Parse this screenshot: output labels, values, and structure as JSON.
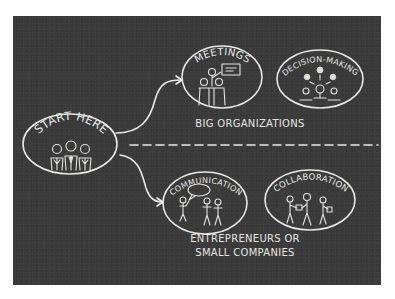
{
  "diagram": {
    "board_color": "#3b3b3b",
    "chalk_color": "#e8e8e4",
    "start_node": {
      "label": "START HERE",
      "people_count": 3
    },
    "upper_branch": {
      "caption": "BIG ORGANIZATIONS",
      "nodes": [
        {
          "label": "MEETINGS",
          "icon": "meeting-presentation-icon"
        },
        {
          "label": "DECISION-MAKING",
          "icon": "decision-making-icon"
        }
      ]
    },
    "lower_branch": {
      "caption_line1": "ENTREPRENEURS OR",
      "caption_line2": "SMALL COMPANIES",
      "nodes": [
        {
          "label": "COMMUNICATION",
          "icon": "speech-bubble-icon"
        },
        {
          "label": "COLLABORATION",
          "icon": "handoff-boxes-icon"
        }
      ]
    },
    "divider": "dashed"
  }
}
